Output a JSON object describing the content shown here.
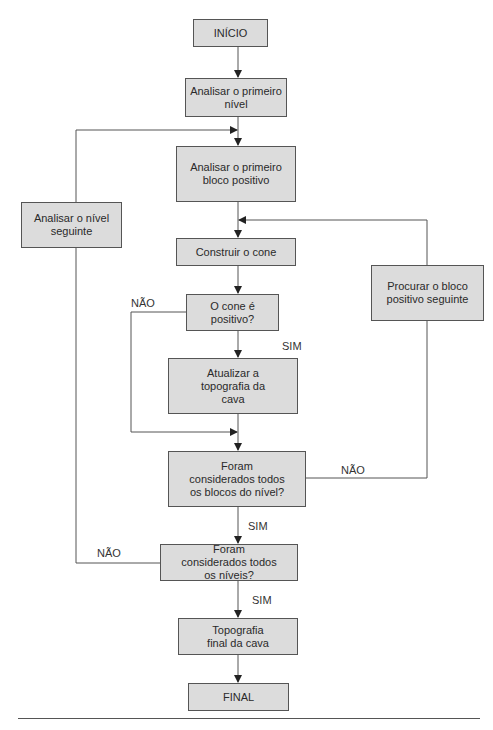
{
  "diagram": {
    "type": "flowchart",
    "nodes": {
      "inicio": "INÍCIO",
      "analisar_primeiro_nivel": "Analisar o primeiro nível",
      "analisar_primeiro_bloco": "Analisar o primeiro bloco positivo",
      "analisar_nivel_seguinte": "Analisar o nível seguinte",
      "construir_cone": "Construir o cone",
      "procurar_bloco": "Procurar o bloco positivo seguinte",
      "cone_positivo": "O cone é positivo?",
      "atualizar_topografia": "Atualizar a topografia da cava",
      "todos_blocos": "Foram considerados todos os blocos do nível?",
      "todos_niveis": "Foram considerados todos os níveis?",
      "topografia_final": "Topografia final da cava",
      "final": "FINAL"
    },
    "edge_labels": {
      "cone_nao": "NÃO",
      "cone_sim": "SIM",
      "blocos_nao": "NÃO",
      "blocos_sim": "SIM",
      "niveis_nao": "NÃO",
      "niveis_sim": "SIM"
    },
    "colors": {
      "box_fill": "#dcdcdc",
      "box_border": "#555555",
      "line": "#555555"
    }
  }
}
